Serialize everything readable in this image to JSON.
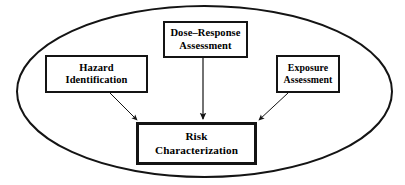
{
  "diagram": {
    "type": "risk-assessment-framework",
    "title": "",
    "container": {
      "shape": "ellipse",
      "name": "risk-assessment-boundary",
      "stroke_color": "#141414",
      "fill_color": "#ffffff",
      "cx": 204.5,
      "cy": 91.5,
      "rx": 187.5,
      "ry": 85.5,
      "stroke_width": 2
    },
    "nodes": [
      {
        "id": "hazard",
        "name": "hazard-identification-node",
        "lines": [
          "Hazard",
          "Identification"
        ],
        "x": 45,
        "y": 55,
        "width": 103,
        "height": 38
      },
      {
        "id": "dose",
        "name": "dose-response-assessment-node",
        "lines": [
          "Dose–Response",
          "Assessment"
        ],
        "x": 163,
        "y": 21,
        "width": 85,
        "height": 37
      },
      {
        "id": "exposure",
        "name": "exposure-assessment-node",
        "lines": [
          "Exposure",
          "Assessment"
        ],
        "x": 276,
        "y": 55,
        "width": 64,
        "height": 38
      },
      {
        "id": "risk",
        "name": "risk-characterization-node",
        "lines": [
          "Risk",
          "Characterization"
        ],
        "x": 136,
        "y": 122,
        "width": 121,
        "height": 43
      }
    ],
    "arrows": [
      {
        "id": "hazard-to-risk",
        "name": "arrow-hazard-to-risk",
        "from": "hazard",
        "to": "risk",
        "x1": 110,
        "y1": 93,
        "x2": 137,
        "y2": 120,
        "stroke_width": 1
      },
      {
        "id": "dose-to-risk",
        "name": "arrow-dose-to-risk",
        "from": "dose",
        "to": "risk",
        "x1": 203,
        "y1": 58,
        "x2": 203,
        "y2": 120,
        "stroke_width": 1.2
      },
      {
        "id": "exposure-to-risk",
        "name": "arrow-exposure-to-risk",
        "from": "exposure",
        "to": "risk",
        "x1": 288,
        "y1": 93,
        "x2": 259,
        "y2": 120,
        "stroke_width": 1
      }
    ]
  }
}
